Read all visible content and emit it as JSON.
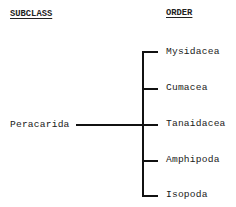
{
  "diagram": {
    "type": "taxonomy-tree",
    "headers": {
      "left": "SUBCLASS",
      "right": "ORDER"
    },
    "root": {
      "label": "Peracarida"
    },
    "children": [
      {
        "label": "Mysidacea"
      },
      {
        "label": "Cumacea"
      },
      {
        "label": "Tanaidacea"
      },
      {
        "label": "Amphipoda"
      },
      {
        "label": "Isopoda"
      }
    ],
    "colors": {
      "line": "#111111",
      "text": "#1a1a1a",
      "background": "#ffffff"
    }
  }
}
